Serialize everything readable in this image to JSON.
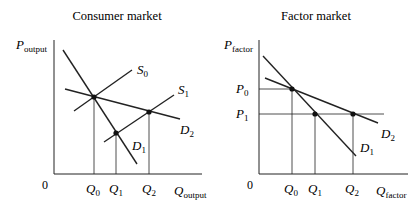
{
  "panels": [
    {
      "title": "Consumer market",
      "y_axis": {
        "symbol": "P",
        "subscript": "output"
      },
      "x_axis": {
        "symbol": "Q",
        "subscript": "output"
      },
      "origin": "0",
      "curves": [
        {
          "name": "S",
          "sub": "0"
        },
        {
          "name": "S",
          "sub": "1"
        },
        {
          "name": "D",
          "sub": "1"
        },
        {
          "name": "D",
          "sub": "2"
        }
      ],
      "x_ticks": [
        {
          "sym": "Q",
          "sub": "0"
        },
        {
          "sym": "Q",
          "sub": "1"
        },
        {
          "sym": "Q",
          "sub": "2"
        }
      ]
    },
    {
      "title": "Factor market",
      "y_axis": {
        "symbol": "P",
        "subscript": "factor"
      },
      "x_axis": {
        "symbol": "Q",
        "subscript": "factor"
      },
      "origin": "0",
      "curves": [
        {
          "name": "D",
          "sub": "1"
        },
        {
          "name": "D",
          "sub": "2"
        }
      ],
      "y_ticks": [
        {
          "sym": "P",
          "sub": "0"
        },
        {
          "sym": "P",
          "sub": "1"
        }
      ],
      "x_ticks": [
        {
          "sym": "Q",
          "sub": "0"
        },
        {
          "sym": "Q",
          "sub": "1"
        },
        {
          "sym": "Q",
          "sub": "2"
        }
      ]
    }
  ]
}
